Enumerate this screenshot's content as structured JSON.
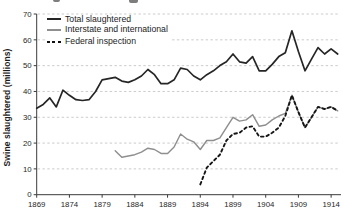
{
  "chart_data": {
    "type": "line",
    "title": "",
    "xlabel": "",
    "ylabel": "Swine slaughtered (millions)",
    "ylim": [
      0,
      70
    ],
    "xlim": [
      1869,
      1915.8
    ],
    "y_ticks": [
      0,
      10,
      20,
      30,
      40,
      50,
      60,
      70
    ],
    "x_ticks": [
      1869,
      1874,
      1879,
      1884,
      1889,
      1894,
      1899,
      1904,
      1909,
      1914
    ],
    "grid": "horizontal-dashed",
    "legend_position": "top-left-inside",
    "colors": {
      "total": "#262626",
      "interstate": "#8f8f8f",
      "federal": "#161616",
      "grid": "#b9b9b9",
      "axis": "#3a3a3a",
      "text": "#1f1f1f"
    },
    "series": [
      {
        "name": "Total slaughtered",
        "line_style": "solid",
        "color_key": "total",
        "start_year": 1869,
        "values": [
          33.5,
          35,
          37.5,
          34,
          40.5,
          38.5,
          36.8,
          36.5,
          36.8,
          40,
          44.5,
          45,
          45.5,
          44,
          43.5,
          44.5,
          46,
          48.5,
          46.5,
          43,
          43,
          44.5,
          49,
          48.5,
          46,
          44.5,
          46.5,
          48,
          50,
          51.5,
          54.5,
          51.5,
          51,
          53.5,
          48,
          48,
          50.5,
          53.5,
          55,
          63.5,
          55.5,
          48,
          52.5,
          57,
          54.5,
          56.5,
          54.5
        ]
      },
      {
        "name": "Interstate and international",
        "line_style": "solid",
        "color_key": "interstate",
        "start_year": 1881,
        "values": [
          17,
          14.5,
          15,
          15.5,
          16.5,
          18,
          17.5,
          16,
          16,
          18.5,
          23.5,
          21.5,
          20.5,
          17.5,
          21,
          21,
          22,
          26,
          30,
          28.5,
          29,
          31,
          26.5,
          27,
          29,
          30.5,
          31.5,
          38.5,
          32,
          26,
          30,
          34,
          33.2,
          34,
          32.5
        ]
      },
      {
        "name": "Federal inspection",
        "line_style": "dashed",
        "color_key": "federal",
        "start_year": 1894,
        "values": [
          4,
          10.5,
          13,
          15.5,
          21,
          23.5,
          24,
          26,
          26.5,
          22.5,
          22.5,
          24,
          26,
          30.5,
          38.5,
          32,
          26,
          30,
          34,
          33.2,
          34,
          32.5
        ]
      }
    ]
  }
}
